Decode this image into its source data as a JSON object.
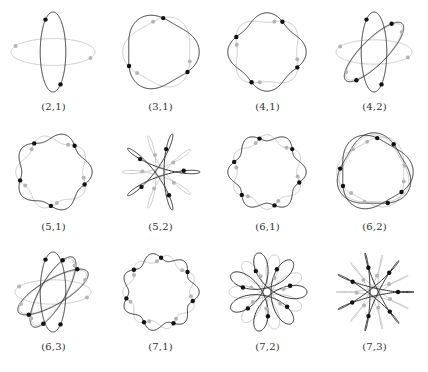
{
  "figure": {
    "panels": [
      {
        "label": "(2,1)",
        "n": 2,
        "k": 1
      },
      {
        "label": "(3,1)",
        "n": 3,
        "k": 1
      },
      {
        "label": "(4,1)",
        "n": 4,
        "k": 1
      },
      {
        "label": "(4,2)",
        "n": 4,
        "k": 2
      },
      {
        "label": "(5,1)",
        "n": 5,
        "k": 1
      },
      {
        "label": "(5,2)",
        "n": 5,
        "k": 2
      },
      {
        "label": "(6,1)",
        "n": 6,
        "k": 1
      },
      {
        "label": "(6,2)",
        "n": 6,
        "k": 2
      },
      {
        "label": "(6,3)",
        "n": 6,
        "k": 3
      },
      {
        "label": "(7,1)",
        "n": 7,
        "k": 1
      },
      {
        "label": "(7,2)",
        "n": 7,
        "k": 2
      },
      {
        "label": "(7,3)",
        "n": 7,
        "k": 3
      }
    ],
    "colors": {
      "primary_curve": "#333333",
      "secondary_curve": "#c4c4c4",
      "primary_dot": "#111111",
      "secondary_dot": "#b5b5b5"
    }
  }
}
